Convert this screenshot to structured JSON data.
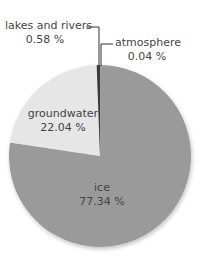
{
  "chart_data": {
    "type": "pie",
    "title": "",
    "slices": [
      {
        "label": "ice",
        "value": 77.34,
        "display": "77.34 %",
        "color": "#9a9a9a"
      },
      {
        "label": "groundwater",
        "value": 22.04,
        "display": "22.04 %",
        "color": "#e6e6e6"
      },
      {
        "label": "lakes and rivers",
        "value": 0.58,
        "display": "0.58 %",
        "color": "#3a3a3a"
      },
      {
        "label": "atmosphere",
        "value": 0.04,
        "display": "0.04 %",
        "color": "#1e1e1e"
      }
    ],
    "legend": "none (callout labels)"
  },
  "labels": {
    "ice": {
      "name": "ice",
      "value": "77.34 %"
    },
    "groundwater": {
      "name": "groundwater",
      "value": "22.04 %"
    },
    "lakes": {
      "name": "lakes and rivers",
      "value": "0.58 %"
    },
    "atmosphere": {
      "name": "atmosphere",
      "value": "0.04 %"
    }
  }
}
